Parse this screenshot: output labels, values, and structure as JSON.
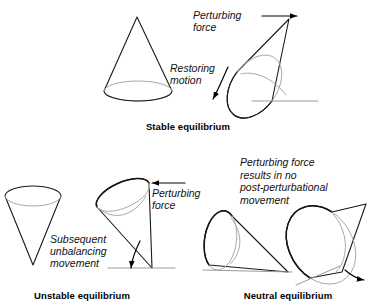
{
  "figure": {
    "background_color": "#ffffff",
    "line_color": "#1a1a1a",
    "hidden_edge_color": "#a8a8a8",
    "ground_color": "#9a9a9a"
  },
  "panels": [
    {
      "id": "stable",
      "caption": "Stable equilibrium",
      "caption_x": 188,
      "caption_y": 130,
      "annotations": [
        {
          "id": "perturbing-force",
          "lines": [
            "Perturbing",
            "force"
          ],
          "x": 193,
          "y": 19,
          "line_height": 12
        },
        {
          "id": "restoring-motion",
          "lines": [
            "Restoring",
            "motion"
          ],
          "x": 170,
          "y": 72,
          "line_height": 12
        }
      ],
      "shapes": {
        "upright_cone": {
          "apex_x": 137,
          "apex_y": 17,
          "base_cx": 138,
          "base_cy": 91,
          "base_rx": 34,
          "base_ry": 10
        },
        "tilted_cone": {
          "apex_x": 289,
          "apex_y": 19,
          "contact_x": 272,
          "contact_y": 101
        }
      },
      "arrows": [
        {
          "id": "force-arrow-right",
          "type": "straight",
          "x1": 262,
          "y1": 16,
          "x2": 299,
          "y2": 16
        },
        {
          "id": "restoring-arrow-curved",
          "type": "curved",
          "path": "M 228 67 C 222 80 218 90 212 101"
        }
      ]
    },
    {
      "id": "unstable",
      "caption": "Unstable equilibrium",
      "caption_x": 82,
      "caption_y": 299,
      "annotations": [
        {
          "id": "subsequent-unbalancing-movement",
          "lines": [
            "Subsequent",
            "unbalancing",
            "movement"
          ],
          "x": 50,
          "y": 243,
          "line_height": 12
        },
        {
          "id": "perturbing-force",
          "lines": [
            "Perturbing",
            "force"
          ],
          "x": 152,
          "y": 197,
          "line_height": 12
        }
      ],
      "shapes": {
        "inverted_cone": {
          "apex_x": 33,
          "apex_y": 265,
          "top_cx": 33,
          "top_cy": 196,
          "top_rx": 28,
          "top_ry": 10
        },
        "tilted_inverted_cone": {
          "apex_x": 152,
          "apex_y": 268
        }
      },
      "arrows": [
        {
          "id": "force-arrow-left",
          "type": "straight",
          "x1": 185,
          "y1": 183,
          "x2": 150,
          "y2": 183
        },
        {
          "id": "unbalancing-arrow-curved",
          "type": "curved",
          "path": "M 140 243 C 135 252 132 260 130 270"
        }
      ]
    },
    {
      "id": "neutral",
      "caption": "Neutral equilibrium",
      "caption_x": 288,
      "caption_y": 299,
      "annotations": [
        {
          "id": "perturbing-force-no-movement",
          "lines": [
            "Perturbing force",
            "results in no",
            "post-perturbational",
            "movement"
          ],
          "x": 240,
          "y": 166,
          "line_height": 12.5
        }
      ],
      "shapes": {
        "lying_cone_left": {
          "apex_x": 288,
          "apex_y": 272,
          "base_cx": 219,
          "base_cy": 240
        },
        "lying_cone_right": {
          "apex_x": 366,
          "apex_y": 204,
          "base_cx": 320,
          "base_cy": 250
        }
      },
      "arrows": [
        {
          "id": "roll-arrow-right",
          "type": "curved",
          "path": "M 347 270 C 355 276 360 279 366 280"
        }
      ]
    }
  ]
}
